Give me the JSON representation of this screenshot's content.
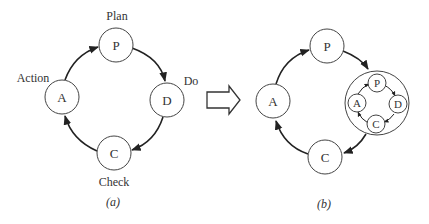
{
  "diagram_a": {
    "nodes": {
      "P": "P",
      "D": "D",
      "C": "C",
      "A": "A"
    },
    "labels": {
      "plan": "Plan",
      "do": "Do",
      "check": "Check",
      "action": "Action"
    },
    "caption": "(a)"
  },
  "diagram_b": {
    "nodes": {
      "P": "P",
      "C": "C",
      "A": "A"
    },
    "inner_nodes": {
      "P": "P",
      "D": "D",
      "C": "C",
      "A": "A"
    },
    "caption": "(b)"
  },
  "colors": {
    "stroke": "#333333",
    "background": "#ffffff"
  }
}
